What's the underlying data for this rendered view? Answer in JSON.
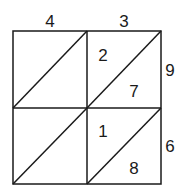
{
  "diagram": {
    "type": "lattice-multiplication",
    "top_digits": [
      "4",
      "3"
    ],
    "right_digits": [
      "9",
      "6"
    ],
    "cells": [
      {
        "row": 0,
        "col": 1,
        "tens": "2",
        "ones": "7"
      },
      {
        "row": 1,
        "col": 1,
        "tens": "1",
        "ones": "8"
      }
    ]
  }
}
